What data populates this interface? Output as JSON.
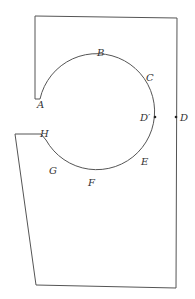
{
  "diagram": {
    "type": "geometric figure",
    "colors": {
      "stroke": "#555555",
      "label": "#333333",
      "point": "#222222"
    },
    "labels": {
      "A": "A",
      "B": "B",
      "C": "C",
      "D_prime": "D′",
      "D": "D",
      "E": "E",
      "F": "F",
      "G": "G",
      "H": "H"
    },
    "points": [
      {
        "name": "A",
        "position": "left end of arc, upper opening"
      },
      {
        "name": "B",
        "position": "top of arc"
      },
      {
        "name": "C",
        "position": "upper right of arc"
      },
      {
        "name": "D′",
        "position": "rightmost point of arc (marked with dot)"
      },
      {
        "name": "D",
        "position": "on right boundary edge (marked with dot)"
      },
      {
        "name": "E",
        "position": "lower right of arc"
      },
      {
        "name": "F",
        "position": "bottom of arc"
      },
      {
        "name": "G",
        "position": "lower left of arc"
      },
      {
        "name": "H",
        "position": "left end of arc, lower opening"
      }
    ]
  }
}
